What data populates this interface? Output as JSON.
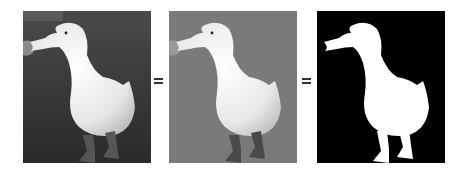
{
  "figure": {
    "type": "equivalence-illustration",
    "panels": [
      {
        "id": "original-photo",
        "description": "White duck standing on dark grass",
        "background": "#3b3b3b",
        "subject": "#efefef"
      },
      {
        "id": "gray-background-photo",
        "description": "White duck on flat gray background",
        "background": "#7a7a7a",
        "subject": "#f2f2f2"
      },
      {
        "id": "silhouette-mask",
        "description": "White duck silhouette on black background",
        "background": "#000000",
        "subject": "#ffffff"
      }
    ],
    "operators": [
      {
        "symbol": "=",
        "color": "#333333"
      },
      {
        "symbol": "=",
        "color": "#333333"
      }
    ]
  }
}
